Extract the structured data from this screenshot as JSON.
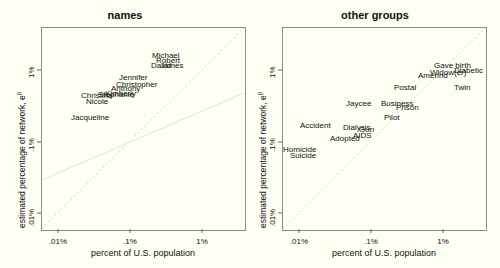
{
  "chart_data": [
    {
      "type": "scatter",
      "title": "names",
      "xlabel": "percent of U.S. population",
      "ylabel": "estimated percentage of network, e^β",
      "x_scale": "log",
      "y_scale": "log",
      "x_ticks": [
        ".01%",
        ".1%",
        "1%"
      ],
      "y_ticks": [
        ".01%",
        ".1%",
        "1%"
      ],
      "xlim": [
        "0.0078%",
        "3%"
      ],
      "ylim": [
        "0.0065%",
        "2.5%"
      ],
      "reference_line": "y = x (dotted)",
      "fit_line": "faint regression line",
      "points": [
        {
          "label": "Michael",
          "x": 1.05,
          "y": 0.52
        },
        {
          "label": "Robert",
          "x": 1.2,
          "y": 0.47
        },
        {
          "label": "David",
          "x": 1.0,
          "y": 0.42
        },
        {
          "label": "James",
          "x": 1.25,
          "y": 0.42
        },
        {
          "label": "Jennifer",
          "x": 0.35,
          "y": 0.26
        },
        {
          "label": "Christopher",
          "x": 0.4,
          "y": 0.21
        },
        {
          "label": "Anthony",
          "x": 0.27,
          "y": 0.19
        },
        {
          "label": "Kimberly",
          "x": 0.22,
          "y": 0.17
        },
        {
          "label": "Stephanie",
          "x": 0.17,
          "y": 0.16
        },
        {
          "label": "Christina",
          "x": 0.13,
          "y": 0.155
        },
        {
          "label": "Nicole",
          "x": 0.14,
          "y": 0.135
        },
        {
          "label": "Jacqueline",
          "x": 0.09,
          "y": 0.09
        }
      ]
    },
    {
      "type": "scatter",
      "title": "other groups",
      "xlabel": "percent of U.S. population",
      "ylabel": "estimated percentage of network, e^β",
      "x_scale": "log",
      "y_scale": "log",
      "x_ticks": [
        ".01%",
        ".1%",
        "1%"
      ],
      "y_ticks": [
        ".01%",
        ".1%",
        "1%"
      ],
      "reference_line": "y = x (dotted)",
      "points": [
        {
          "label": "Gave birth",
          "x": 1.0,
          "y": 0.52
        },
        {
          "label": "Diabetic",
          "x": 1.6,
          "y": 0.5
        },
        {
          "label": "Widow(er)",
          "x": 1.1,
          "y": 0.45
        },
        {
          "label": "Amerind",
          "x": 0.7,
          "y": 0.42
        },
        {
          "label": "Twin",
          "x": 1.8,
          "y": 0.28
        },
        {
          "label": "Postal",
          "x": 0.33,
          "y": 0.26
        },
        {
          "label": "Jaycee",
          "x": 0.09,
          "y": 0.13
        },
        {
          "label": "Business",
          "x": 0.32,
          "y": 0.13
        },
        {
          "label": "Prison",
          "x": 0.4,
          "y": 0.125
        },
        {
          "label": "Pilot",
          "x": 0.3,
          "y": 0.1
        },
        {
          "label": "Accident",
          "x": 0.035,
          "y": 0.075
        },
        {
          "label": "Dialysis",
          "x": 0.09,
          "y": 0.073
        },
        {
          "label": "Gun",
          "x": 0.11,
          "y": 0.07
        },
        {
          "label": "AIDS",
          "x": 0.11,
          "y": 0.058
        },
        {
          "label": "Adopted",
          "x": 0.07,
          "y": 0.05
        },
        {
          "label": "Homicide",
          "x": 0.015,
          "y": 0.036
        },
        {
          "label": "Suicide",
          "x": 0.018,
          "y": 0.031
        }
      ]
    }
  ],
  "panels": [
    {
      "title": "names",
      "xlabel": "percent of U.S. population",
      "ylabel": "estimated percentage of network, e",
      "ylabel_sup": "β",
      "xticks": [
        ".01%",
        ".1%",
        "1%"
      ],
      "yticks": [
        ".01%",
        ".1%",
        "1%"
      ],
      "labels": [
        {
          "t": "Michael",
          "x": 152,
          "y": 52
        },
        {
          "t": "Robert",
          "x": 156,
          "y": 57
        },
        {
          "t": "David",
          "x": 151,
          "y": 62
        },
        {
          "t": "James",
          "x": 160,
          "y": 62
        },
        {
          "t": "Jennifer",
          "x": 119,
          "y": 74
        },
        {
          "t": "Christopher",
          "x": 116,
          "y": 81
        },
        {
          "t": "Anthony",
          "x": 111,
          "y": 85
        },
        {
          "t": "Kimberly",
          "x": 105,
          "y": 90
        },
        {
          "t": "Stephanie",
          "x": 98,
          "y": 91
        },
        {
          "t": "Christina",
          "x": 81,
          "y": 92
        },
        {
          "t": "Nicole",
          "x": 86,
          "y": 98
        },
        {
          "t": "Jacqueline",
          "x": 71,
          "y": 114
        }
      ]
    },
    {
      "title": "other groups",
      "xlabel": "percent of U.S. population",
      "ylabel": "estimated percentage of network, e",
      "ylabel_sup": "β",
      "xticks": [
        ".01%",
        ".1%",
        "1%"
      ],
      "yticks": [
        ".01%",
        ".1%",
        "1%"
      ],
      "labels": [
        {
          "t": "Gave birth",
          "x": 184,
          "y": 62
        },
        {
          "t": "Diabetic",
          "x": 204,
          "y": 67
        },
        {
          "t": "Widow(er)",
          "x": 180,
          "y": 69
        },
        {
          "t": "Amerind",
          "x": 168,
          "y": 72
        },
        {
          "t": "Twin",
          "x": 204,
          "y": 84
        },
        {
          "t": "Postal",
          "x": 144,
          "y": 84
        },
        {
          "t": "Jaycee",
          "x": 96,
          "y": 100
        },
        {
          "t": "Business",
          "x": 131,
          "y": 100
        },
        {
          "t": "Prison",
          "x": 146,
          "y": 104
        },
        {
          "t": "Pilot",
          "x": 134,
          "y": 114
        },
        {
          "t": "Accident",
          "x": 50,
          "y": 122
        },
        {
          "t": "Dialysis",
          "x": 93,
          "y": 124
        },
        {
          "t": "Gun",
          "x": 109,
          "y": 126
        },
        {
          "t": "AIDS",
          "x": 103,
          "y": 132
        },
        {
          "t": "Adopted",
          "x": 80,
          "y": 135
        },
        {
          "t": "Homicide",
          "x": 33,
          "y": 146
        },
        {
          "t": "Suicide",
          "x": 40,
          "y": 152
        }
      ]
    }
  ]
}
